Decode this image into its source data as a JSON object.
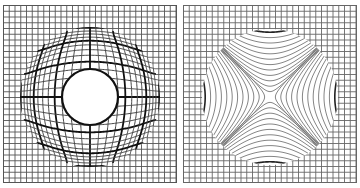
{
  "figure": {
    "panels": [
      {
        "id": "left",
        "description": "Square grid with circular region showing pincushion-like distortion and a clear central circle",
        "distortion": "radial",
        "grid_color": "#555555",
        "line_color": "#111111"
      },
      {
        "id": "right",
        "description": "Square grid with circular region showing saddle (hyperbolic / astigmatic) distortion",
        "distortion": "saddle",
        "grid_color": "#666666",
        "line_color": "#333333"
      }
    ]
  }
}
